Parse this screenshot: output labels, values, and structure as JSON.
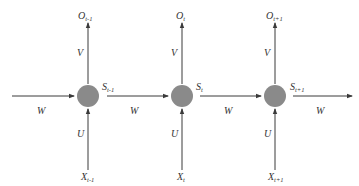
{
  "diagram": {
    "type": "unrolled-rnn",
    "node_color": "#8a8a8a",
    "edge_color": "#3a3a3a",
    "nodes": [
      {
        "state": {
          "base": "S",
          "sub": "t-1"
        },
        "output": {
          "base": "O",
          "sub": "t-1"
        },
        "input": {
          "base": "X",
          "sub": "t-1"
        },
        "out_weight": "V",
        "in_weight": "U"
      },
      {
        "state": {
          "base": "S",
          "sub": "t"
        },
        "output": {
          "base": "O",
          "sub": "t"
        },
        "input": {
          "base": "X",
          "sub": "t"
        },
        "out_weight": "V",
        "in_weight": "U"
      },
      {
        "state": {
          "base": "S",
          "sub": "t+1"
        },
        "output": {
          "base": "O",
          "sub": "t+1"
        },
        "input": {
          "base": "X",
          "sub": "t+1"
        },
        "out_weight": "V",
        "in_weight": "U"
      }
    ],
    "recurrent_edges": [
      {
        "label": "W"
      },
      {
        "label": "W"
      },
      {
        "label": "W"
      },
      {
        "label": "W"
      }
    ]
  }
}
